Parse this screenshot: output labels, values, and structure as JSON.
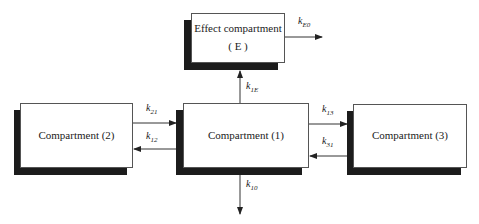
{
  "diagram": {
    "type": "pharmacokinetic-compartment-model",
    "nodes": [
      {
        "id": "E",
        "label_line1": "Effect compartment",
        "label_line2": "( E )"
      },
      {
        "id": "1",
        "label": "Compartment (1)"
      },
      {
        "id": "2",
        "label": "Compartment (2)"
      },
      {
        "id": "3",
        "label": "Compartment (3)"
      }
    ],
    "edges": [
      {
        "from": "1",
        "to": "E",
        "k": "k",
        "sub": "1E"
      },
      {
        "from": "E",
        "to": "out",
        "k": "k",
        "sub": "E0"
      },
      {
        "from": "2",
        "to": "1",
        "k": "k",
        "sub": "21"
      },
      {
        "from": "1",
        "to": "2",
        "k": "k",
        "sub": "12"
      },
      {
        "from": "1",
        "to": "3",
        "k": "k",
        "sub": "13"
      },
      {
        "from": "3",
        "to": "1",
        "k": "k",
        "sub": "31"
      },
      {
        "from": "1",
        "to": "out",
        "k": "k",
        "sub": "10"
      }
    ]
  }
}
